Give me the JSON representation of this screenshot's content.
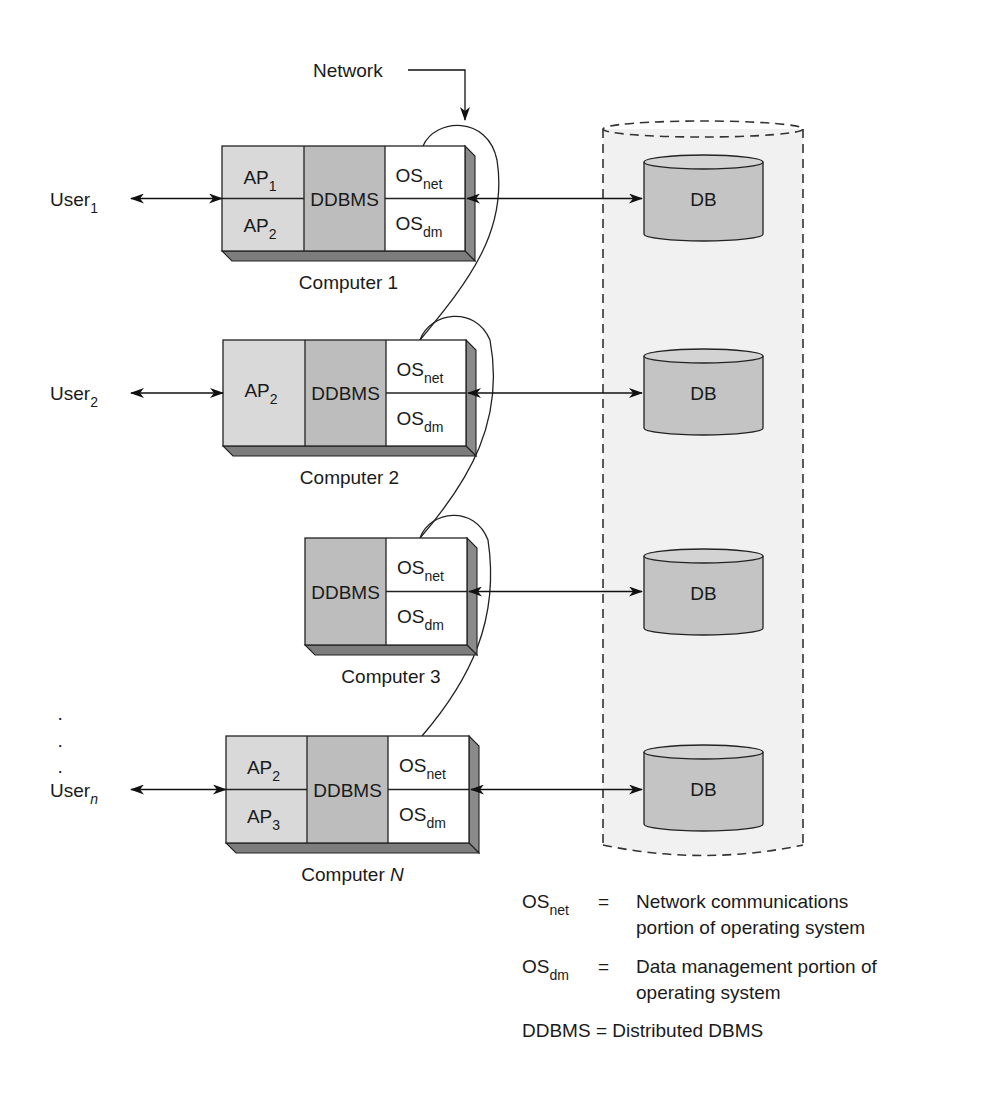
{
  "network_label": "Network",
  "computers": [
    {
      "id": "computer-1",
      "caption": "Computer 1",
      "caption_italic": "",
      "user": {
        "base": "User",
        "sub": "1",
        "italic": false
      },
      "x": 222,
      "y": 146,
      "w": 243,
      "h": 105,
      "ap": [
        {
          "base": "AP",
          "sub": "1"
        },
        {
          "base": "AP",
          "sub": "2"
        }
      ],
      "ap_w": 82,
      "dd_w": 81
    },
    {
      "id": "computer-2",
      "caption": "Computer 2",
      "caption_italic": "",
      "user": {
        "base": "User",
        "sub": "2",
        "italic": false
      },
      "x": 223,
      "y": 340,
      "w": 243,
      "h": 106,
      "ap": [
        {
          "base": "AP",
          "sub": "2"
        }
      ],
      "ap_w": 82,
      "dd_w": 81
    },
    {
      "id": "computer-3",
      "caption": "Computer 3",
      "caption_italic": "",
      "user": null,
      "x": 305,
      "y": 538,
      "w": 162,
      "h": 107,
      "ap": [],
      "ap_w": 0,
      "dd_w": 81
    },
    {
      "id": "computer-n",
      "caption": "Computer ",
      "caption_italic": "N",
      "user": {
        "base": "User",
        "sub": "n",
        "italic": true
      },
      "x": 226,
      "y": 736,
      "w": 243,
      "h": 107,
      "ap": [
        {
          "base": "AP",
          "sub": "2"
        },
        {
          "base": "AP",
          "sub": "3"
        }
      ],
      "ap_w": 81,
      "dd_w": 81
    }
  ],
  "ddbms_label": "DDBMS",
  "os_net": {
    "base": "OS",
    "sub": "net"
  },
  "os_dm": {
    "base": "OS",
    "sub": "dm"
  },
  "db_label": "DB",
  "databases_y": [
    198,
    392,
    592,
    788
  ],
  "ellipsis_dots": [
    "·",
    "·",
    "·"
  ],
  "legend": [
    {
      "term_base": "OS",
      "term_sub": "net",
      "eq": "=",
      "lines": [
        "Network communications",
        "portion of operating system"
      ]
    },
    {
      "term_base": "OS",
      "term_sub": "dm",
      "eq": "=",
      "lines": [
        "Data management portion of",
        "operating system"
      ]
    },
    {
      "term_base": "DDBMS",
      "term_sub": "",
      "eq": "=",
      "lines": [
        "Distributed DBMS"
      ]
    }
  ],
  "colors": {
    "ap_fill": "#d9d9d9",
    "ddbms_fill": "#bdbdbd",
    "os_fill": "#ffffff",
    "db_fill": "#c4c4c4",
    "container_fill": "#f1f1f1",
    "line": "#222222"
  }
}
